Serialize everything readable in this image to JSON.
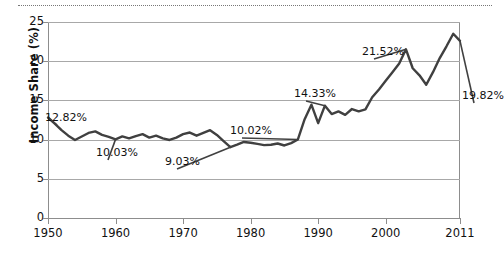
{
  "chart_data": {
    "type": "line",
    "title": "",
    "xlabel": "",
    "ylabel": "Income Share (%)",
    "xlim": [
      1950,
      2011
    ],
    "ylim": [
      0,
      25
    ],
    "ytick_labels": [
      "0",
      "5",
      "10",
      "15",
      "20",
      "25"
    ],
    "ytick_values": [
      0,
      5,
      10,
      15,
      20,
      25
    ],
    "xtick_labels": [
      "1950",
      "1960",
      "1970",
      "1980",
      "1990",
      "2000",
      "2011"
    ],
    "xtick_values": [
      1950,
      1960,
      1970,
      1980,
      1990,
      2000,
      2011
    ],
    "grid": "horizontal",
    "legend": "none",
    "line_color": "#404040",
    "grid_color": "#a8a8a8",
    "axis_color": "#8d8d8d",
    "x": [
      1950,
      1951,
      1952,
      1953,
      1954,
      1955,
      1956,
      1957,
      1958,
      1959,
      1960,
      1961,
      1962,
      1963,
      1964,
      1965,
      1966,
      1967,
      1968,
      1969,
      1970,
      1971,
      1972,
      1973,
      1974,
      1975,
      1976,
      1977,
      1978,
      1979,
      1980,
      1981,
      1982,
      1983,
      1984,
      1985,
      1986,
      1987,
      1988,
      1989,
      1990,
      1991,
      1992,
      1993,
      1994,
      1995,
      1996,
      1997,
      1998,
      1999,
      2000,
      2001,
      2002,
      2003,
      2004,
      2005,
      2006,
      2007,
      2008,
      2009,
      2010,
      2011
    ],
    "values": [
      12.82,
      12.05,
      11.2,
      10.5,
      9.95,
      10.4,
      10.85,
      11.05,
      10.6,
      10.35,
      10.03,
      10.4,
      10.15,
      10.45,
      10.7,
      10.25,
      10.5,
      10.15,
      9.95,
      10.25,
      10.7,
      10.9,
      10.5,
      10.85,
      11.2,
      10.6,
      9.8,
      9.03,
      9.35,
      9.7,
      9.6,
      9.45,
      9.3,
      9.35,
      9.5,
      9.25,
      9.55,
      10.02,
      12.6,
      14.45,
      12.1,
      14.33,
      13.25,
      13.6,
      13.15,
      13.9,
      13.6,
      13.85,
      15.4,
      16.4,
      17.5,
      18.6,
      19.7,
      21.52,
      19.1,
      18.2,
      17.0,
      18.6,
      20.4,
      21.9,
      23.5,
      22.6
    ],
    "series_tail": [
      21.0,
      18.1,
      19.82
    ],
    "annotations": [
      {
        "label": "12.82%",
        "year": 1950,
        "value": 12.82,
        "left_px": 45,
        "top_px": 111
      },
      {
        "label": "10.03%",
        "year": 1960,
        "value": 10.03,
        "left_px": 96,
        "top_px": 146
      },
      {
        "label": "9.03%",
        "year": 1977,
        "value": 9.03,
        "left_px": 165,
        "top_px": 155
      },
      {
        "label": "10.02%",
        "year": 1987,
        "value": 10.02,
        "left_px": 230,
        "top_px": 124
      },
      {
        "label": "14.33%",
        "year": 1991,
        "value": 14.33,
        "left_px": 294,
        "top_px": 87
      },
      {
        "label": "21.52%",
        "year": 2003,
        "value": 21.52,
        "left_px": 362,
        "top_px": 45
      },
      {
        "label": "19.82%",
        "year": 2011,
        "value": 19.82,
        "left_px": 462,
        "top_px": 89
      }
    ]
  }
}
